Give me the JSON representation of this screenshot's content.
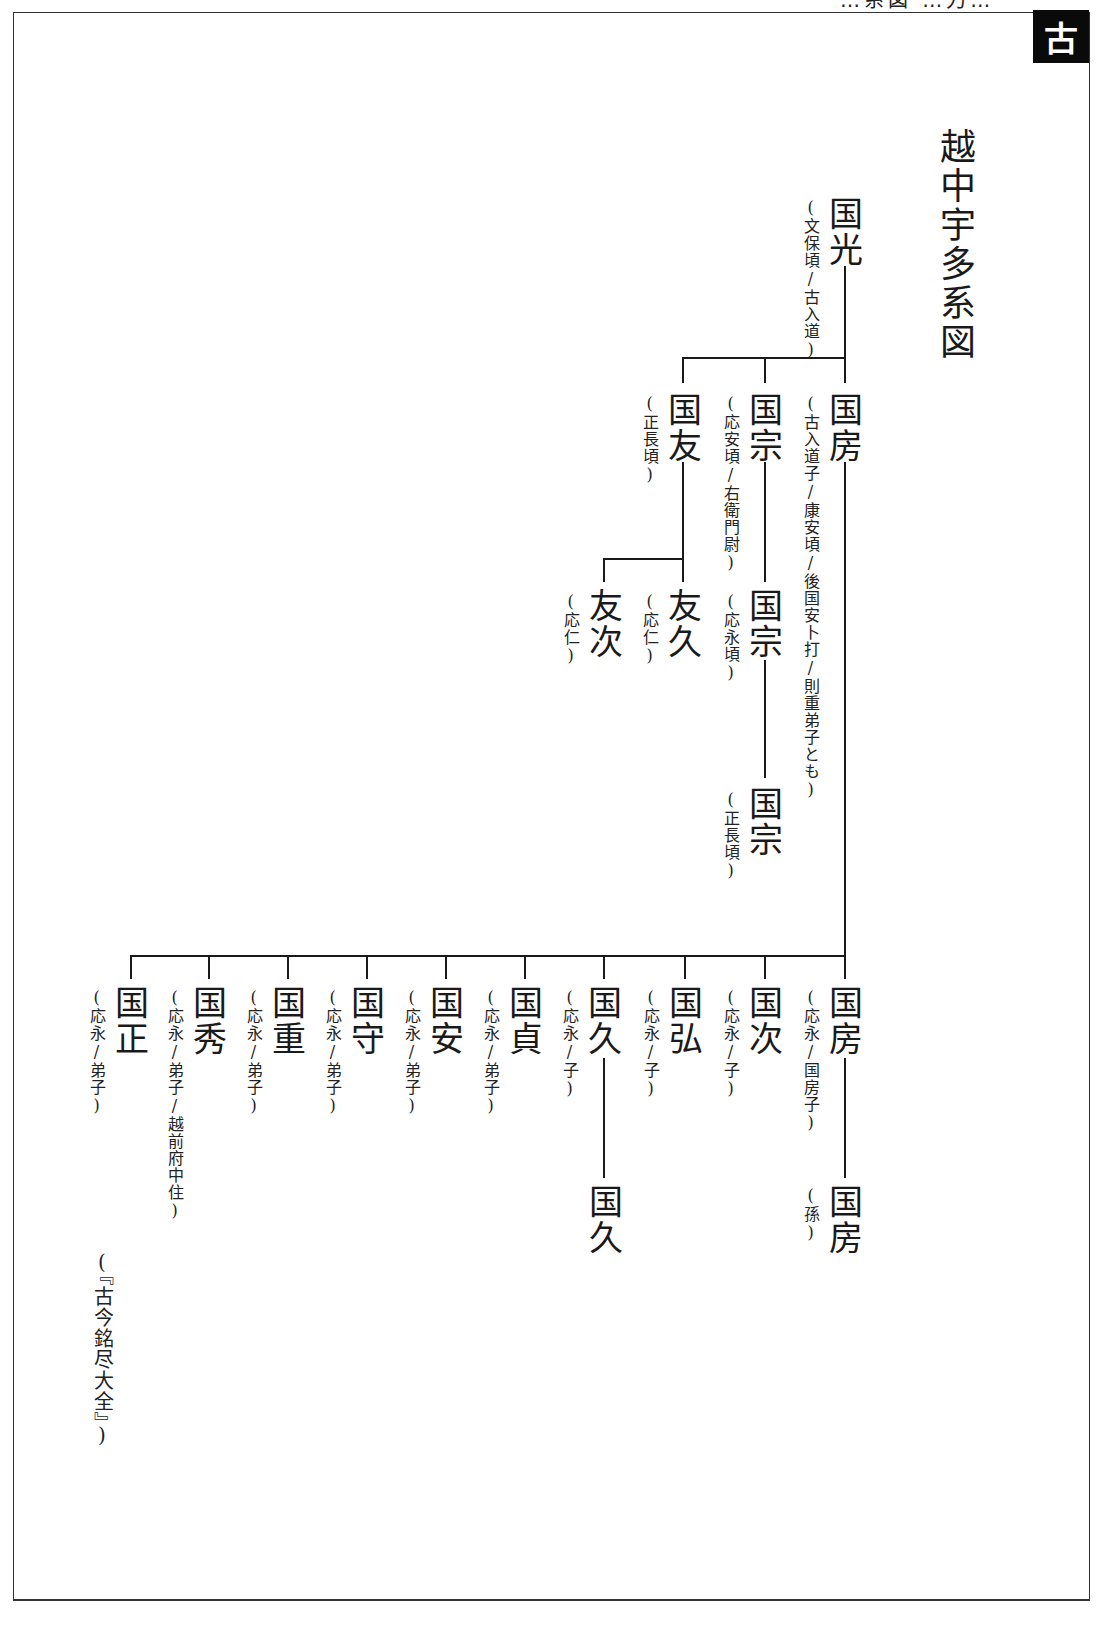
{
  "page": {
    "header_partial": "…系図 …刀…",
    "section_tab": "古",
    "title": "越中宇多系図",
    "source": "『古今銘尽大全』"
  },
  "tree": {
    "root": {
      "name": "国光",
      "note": "文保頃/古入道"
    },
    "gen2": [
      {
        "name": "国房",
        "note": "古入道子/康安頃/後国安卜打/則重弟子とも"
      },
      {
        "name": "国宗",
        "note": "応安頃/右衛門尉"
      },
      {
        "name": "国友",
        "note": "正長頃"
      }
    ],
    "gen3": [
      {
        "name": "国宗",
        "note": "応永頃",
        "parent": "国宗"
      },
      {
        "name": "友久",
        "note": "応仁",
        "parent": "国友"
      },
      {
        "name": "友次",
        "note": "応仁",
        "parent": "国友"
      }
    ],
    "gen4_kunimune": {
      "name": "国宗",
      "note": "正長頃"
    },
    "kunifusa_children": [
      {
        "name": "国房",
        "note": "応永/国房子"
      },
      {
        "name": "国次",
        "note": "応永/子"
      },
      {
        "name": "国弘",
        "note": "応永/子"
      },
      {
        "name": "国久",
        "note": "応永/子"
      },
      {
        "name": "国貞",
        "note": "応永/弟子"
      },
      {
        "name": "国安",
        "note": "応永/弟子"
      },
      {
        "name": "国守",
        "note": "応永/弟子"
      },
      {
        "name": "国重",
        "note": "応永/弟子"
      },
      {
        "name": "国秀",
        "note": "応永/弟子/越前府中住"
      },
      {
        "name": "国正",
        "note": "応永/弟子"
      }
    ],
    "grandchildren": [
      {
        "name": "国房",
        "note": "孫",
        "parent": "国房"
      },
      {
        "name": "国久",
        "note": "",
        "parent": "国久"
      }
    ]
  }
}
